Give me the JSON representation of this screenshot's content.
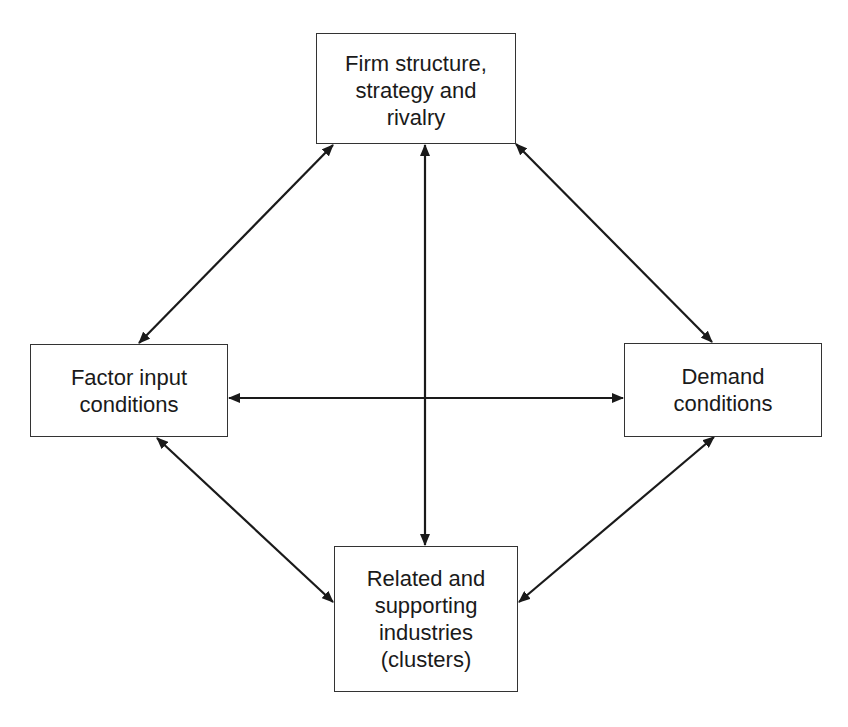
{
  "diagram": {
    "type": "relationship-diagram",
    "nodes": [
      {
        "id": "firm",
        "label": "Firm structure,\nstrategy and\nrivalry",
        "position": "top"
      },
      {
        "id": "factor",
        "label": "Factor input\nconditions",
        "position": "left"
      },
      {
        "id": "demand",
        "label": "Demand\nconditions",
        "position": "right"
      },
      {
        "id": "related",
        "label": "Related and\nsupporting\nindustries\n(clusters)",
        "position": "bottom"
      }
    ],
    "edges": [
      {
        "from": "firm",
        "to": "factor",
        "direction": "bidirectional"
      },
      {
        "from": "firm",
        "to": "demand",
        "direction": "bidirectional"
      },
      {
        "from": "firm",
        "to": "related",
        "direction": "bidirectional"
      },
      {
        "from": "factor",
        "to": "demand",
        "direction": "bidirectional"
      },
      {
        "from": "factor",
        "to": "related",
        "direction": "bidirectional"
      },
      {
        "from": "demand",
        "to": "related",
        "direction": "bidirectional"
      }
    ],
    "colors": {
      "line": "#1a1a1a",
      "border": "#333333",
      "background": "#ffffff"
    }
  },
  "caption": ""
}
